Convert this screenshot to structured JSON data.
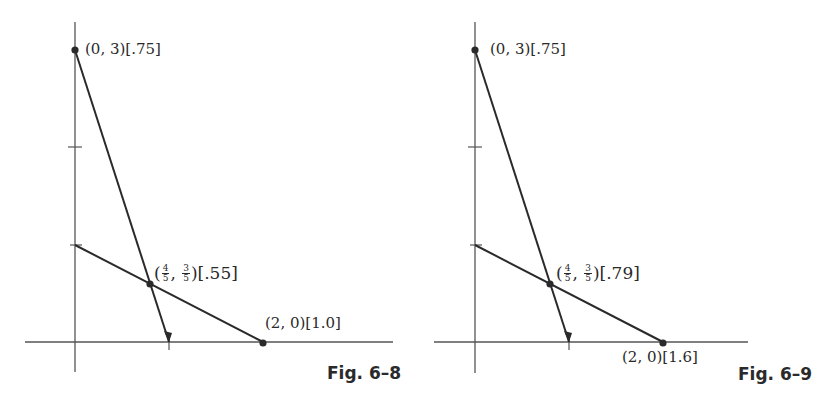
{
  "figures": [
    {
      "id": "fig-6-8",
      "caption": "Fig. 6–8",
      "origin_px": [
        75,
        342
      ],
      "scale_px": [
        94,
        97.5
      ],
      "x_axis_px": [
        25,
        393
      ],
      "y_axis_px": [
        22,
        372
      ],
      "y_ticks": [
        1,
        2
      ],
      "x_ticks": [
        1
      ],
      "points": [
        {
          "name": "top-vertex",
          "x": 0,
          "y": 3,
          "label": "(0, 3)[.75]"
        },
        {
          "name": "intersection",
          "x": 0.8,
          "y": 0.6,
          "label_prefix": "(",
          "frac_x": {
            "num": "4",
            "den": "5"
          },
          "sep": ", ",
          "frac_y": {
            "num": "3",
            "den": "5"
          },
          "label_suffix": ")[.55]"
        },
        {
          "name": "right-vertex",
          "x": 2,
          "y": 0,
          "label": "(2, 0)[1.0]"
        }
      ],
      "lines": [
        {
          "name": "steep-line",
          "from": [
            0,
            3
          ],
          "to": [
            1,
            0
          ],
          "arrow": true
        },
        {
          "name": "shallow-line",
          "from": [
            0,
            1
          ],
          "to": [
            2,
            0
          ],
          "arrow": false
        }
      ]
    },
    {
      "id": "fig-6-9",
      "caption": "Fig. 6–9",
      "origin_px": [
        475,
        342
      ],
      "scale_px": [
        94,
        97.5
      ],
      "x_axis_px": [
        434,
        748
      ],
      "y_axis_px": [
        22,
        373
      ],
      "y_ticks": [
        1,
        2
      ],
      "x_ticks": [
        1
      ],
      "points": [
        {
          "name": "top-vertex",
          "x": 0,
          "y": 3,
          "label": "(0, 3)[.75]"
        },
        {
          "name": "intersection",
          "x": 0.8,
          "y": 0.6,
          "label_prefix": "(",
          "frac_x": {
            "num": "4",
            "den": "5"
          },
          "sep": ", ",
          "frac_y": {
            "num": "3",
            "den": "5"
          },
          "label_suffix": ")[.79]"
        },
        {
          "name": "right-vertex",
          "x": 2,
          "y": 0,
          "label": "(2, 0)[1.6]"
        }
      ],
      "lines": [
        {
          "name": "steep-line",
          "from": [
            0,
            3
          ],
          "to": [
            1,
            0
          ],
          "arrow": true
        },
        {
          "name": "shallow-line",
          "from": [
            0,
            1
          ],
          "to": [
            2,
            0
          ],
          "arrow": false
        }
      ]
    }
  ],
  "colors": {
    "ink": "#2a2a2a",
    "axis": "#555555",
    "background": "#ffffff"
  }
}
